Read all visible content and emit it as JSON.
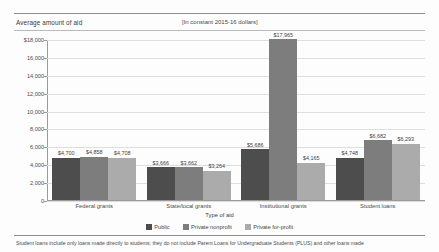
{
  "chart_data": {
    "type": "bar",
    "title": "Average amount of aid",
    "subtitle": "[In constant 2015-16 dollars]",
    "xlabel": "Type of aid",
    "ylabel": "",
    "ylim": [
      0,
      18000
    ],
    "ytick_values": [
      18000,
      16000,
      14000,
      12000,
      10000,
      8000,
      6000,
      4000,
      2000,
      0
    ],
    "ytick_labels": [
      "$18,000",
      "16,000",
      "14,000",
      "12,000",
      "10,000",
      "8,000",
      "6,000",
      "4,000",
      "2,000",
      "0"
    ],
    "grid": true,
    "legend_position": "bottom",
    "categories": [
      "Federal grants",
      "State/local grants",
      "Institutional grants",
      "Student loans"
    ],
    "series": [
      {
        "name": "Public",
        "color": "#4d4d4d",
        "values": [
          4700,
          3666,
          5686,
          4748
        ],
        "labels": [
          "$4,700",
          "$3,666",
          "$5,686",
          "$4,748"
        ]
      },
      {
        "name": "Private nonprofit",
        "color": "#7d7d7d",
        "values": [
          4858,
          3662,
          17965,
          6682
        ],
        "labels": [
          "$4,858",
          "$3,662",
          "$17,965",
          "$6,682"
        ]
      },
      {
        "name": "Private for-profit",
        "color": "#ababab",
        "values": [
          4708,
          3264,
          4165,
          6293
        ],
        "labels": [
          "$4,708",
          "$3,264",
          "$4,165",
          "$6,293"
        ]
      }
    ],
    "footnote": "Student loans include only loans made directly to students; they do not include Parent Loans for Undergraduate Students (PLUS) and other loans made"
  }
}
